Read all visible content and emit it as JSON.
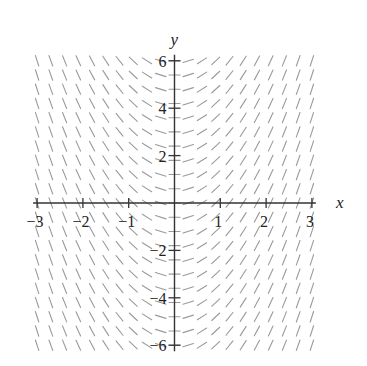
{
  "chart_data": {
    "type": "slope_field",
    "title": "",
    "equation": "dy/dx = 2x",
    "xlabel": "x",
    "ylabel": "y",
    "xlim": [
      -3,
      3
    ],
    "ylim": [
      -6,
      6
    ],
    "x_ticks": [
      -3,
      -2,
      -1,
      1,
      2,
      3
    ],
    "x_tick_labels": [
      "−3",
      "−2",
      "−1",
      "1",
      "2",
      "3"
    ],
    "y_ticks": [
      -6,
      -4,
      -2,
      2,
      4,
      6
    ],
    "y_tick_labels": [
      "−6",
      "−4",
      "−2",
      "2",
      "4",
      "6"
    ],
    "grid": false,
    "legend": null,
    "field_grid": {
      "x_start": -3,
      "x_end": 3,
      "x_step": 0.3,
      "y_start": -6,
      "y_end": 6,
      "y_step": 0.6
    },
    "slope_coefficient": 2,
    "segment_length_px": 11,
    "colors": {
      "axis": "#333333",
      "segment": "#9a9a9a",
      "text": "#222222"
    }
  },
  "layout": {
    "origin_px": [
      174.5,
      203
    ],
    "x_unit_px": 45.8,
    "y_unit_px": 23.7
  }
}
